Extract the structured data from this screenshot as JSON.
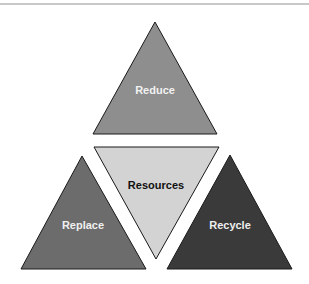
{
  "diagram": {
    "type": "triangle-arrangement",
    "shapes": [
      {
        "id": "reduce",
        "label": "Reduce",
        "fill": "#8e8e8e",
        "text_color": "#f2f2f2",
        "orientation": "up",
        "position": "top"
      },
      {
        "id": "resources",
        "label": "Resources",
        "fill": "#d3d3d3",
        "text_color": "#111111",
        "orientation": "down",
        "position": "center"
      },
      {
        "id": "replace",
        "label": "Replace",
        "fill": "#6c6c6c",
        "text_color": "#f0f0f0",
        "orientation": "up",
        "position": "bottom-left"
      },
      {
        "id": "recycle",
        "label": "Recycle",
        "fill": "#3a3a3a",
        "text_color": "#eeeeee",
        "orientation": "up",
        "position": "bottom-right"
      }
    ]
  }
}
